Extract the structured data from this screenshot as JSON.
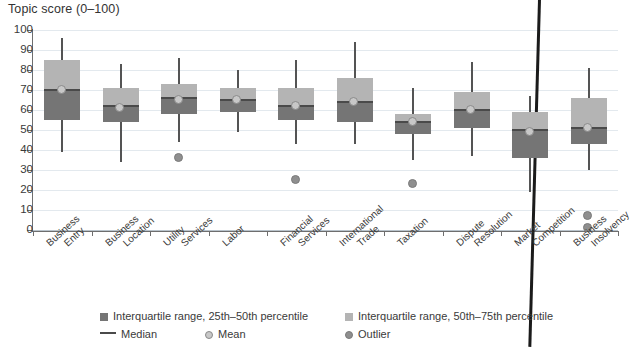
{
  "chart_data": {
    "type": "box",
    "title": "Topic score (0–100)",
    "xlabel": "",
    "ylabel": "Topic score (0–100)",
    "ylim": [
      0,
      100
    ],
    "ytick_step": 10,
    "yticks": [
      100,
      90,
      80,
      70,
      60,
      50,
      40,
      30,
      20,
      10,
      0
    ],
    "grid": true,
    "legend_position": "bottom",
    "categories": [
      "Business Entry",
      "Business Location",
      "Utility Services",
      "Labor",
      "Financial Services",
      "International Trade",
      "Taxation",
      "Dispute Resolution",
      "Market Competition",
      "Business Insolvency"
    ],
    "boxes": [
      {
        "category": "Business Entry",
        "whisker_low": 39,
        "q25": 55,
        "median": 70,
        "q75": 85,
        "whisker_high": 96,
        "mean": 70,
        "outliers": []
      },
      {
        "category": "Business Location",
        "whisker_low": 34,
        "q25": 54,
        "median": 62,
        "q75": 71,
        "whisker_high": 83,
        "mean": 61,
        "outliers": []
      },
      {
        "category": "Utility Services",
        "whisker_low": 44,
        "q25": 58,
        "median": 66,
        "q75": 73,
        "whisker_high": 86,
        "mean": 65,
        "outliers": [
          36
        ]
      },
      {
        "category": "Labor",
        "whisker_low": 49,
        "q25": 59,
        "median": 65,
        "q75": 71,
        "whisker_high": 80,
        "mean": 65,
        "outliers": []
      },
      {
        "category": "Financial Services",
        "whisker_low": 43,
        "q25": 55,
        "median": 62,
        "q75": 71,
        "whisker_high": 85,
        "mean": 62,
        "outliers": [
          25
        ]
      },
      {
        "category": "International Trade",
        "whisker_low": 43,
        "q25": 54,
        "median": 64,
        "q75": 76,
        "whisker_high": 94,
        "mean": 64,
        "outliers": []
      },
      {
        "category": "Taxation",
        "whisker_low": 35,
        "q25": 48,
        "median": 54,
        "q75": 58,
        "whisker_high": 71,
        "mean": 54,
        "outliers": [
          23
        ]
      },
      {
        "category": "Dispute Resolution",
        "whisker_low": 37,
        "q25": 51,
        "median": 60,
        "q75": 69,
        "whisker_high": 84,
        "mean": 60,
        "outliers": []
      },
      {
        "category": "Market Competition",
        "whisker_low": 19,
        "q25": 36,
        "median": 50,
        "q75": 59,
        "whisker_high": 67,
        "mean": 49,
        "outliers": []
      },
      {
        "category": "Business Insolvency",
        "whisker_low": 30,
        "q25": 43,
        "median": 51,
        "q75": 66,
        "whisker_high": 81,
        "mean": 51,
        "outliers": [
          7,
          1
        ]
      }
    ],
    "legend": [
      {
        "key": "iqr-lower",
        "marker": "dark-square",
        "label": "Interquartile range, 25th–50th percentile"
      },
      {
        "key": "iqr-upper",
        "marker": "light-square",
        "label": "Interquartile range, 50th–75th percentile"
      },
      {
        "key": "median",
        "marker": "line",
        "label": "Median"
      },
      {
        "key": "mean",
        "marker": "light-circle",
        "label": "Mean"
      },
      {
        "key": "outlier",
        "marker": "gray-circle",
        "label": "Outlier"
      }
    ],
    "colors": {
      "iqr_lower": "#757575",
      "iqr_upper": "#b4b4b4",
      "median": "#4a4a4a",
      "mean": "#c8c8c8",
      "outlier": "#8f8f8f",
      "gridline": "#e3e9ee",
      "axis": "#6e6e6e",
      "divider": "#1b1b1b"
    }
  }
}
